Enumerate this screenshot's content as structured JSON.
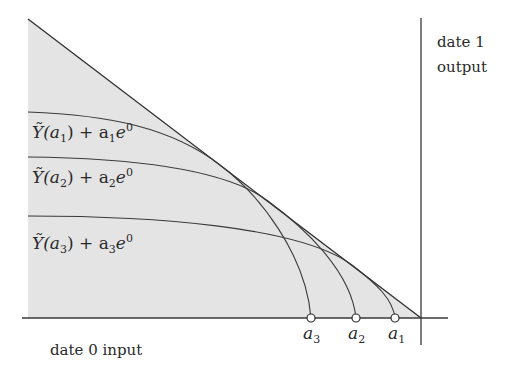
{
  "diagram": {
    "type": "economics-tradeoff-diagram",
    "axes": {
      "x_label": "date 0 input",
      "y_label_line1": "date 1",
      "y_label_line2": "output"
    },
    "colors": {
      "shade": "#e4e4e4",
      "line": "#2e2e2e",
      "axis": "#3a3a3a",
      "text": "#2a2a2a",
      "point_fill": "#ffffff"
    },
    "curves": [
      {
        "id": "curve-a1",
        "label_main": "Ỹ(a",
        "label_sub": "1",
        "label_rest": ") + a",
        "label_sub2": "1",
        "label_e": "e",
        "label_sup": "0",
        "ends_at": "a3"
      },
      {
        "id": "curve-a2",
        "label_main": "Ỹ(a",
        "label_sub": "2",
        "label_rest": ") + a",
        "label_sub2": "2",
        "label_e": "e",
        "label_sup": "0",
        "ends_at": "a2"
      },
      {
        "id": "curve-a3",
        "label_main": "Ỹ(a",
        "label_sub": "3",
        "label_rest": ") + a",
        "label_sub2": "3",
        "label_e": "e",
        "label_sup": "0",
        "ends_at": "a1"
      }
    ],
    "points": [
      {
        "name": "a",
        "sub": "3",
        "x": 311
      },
      {
        "name": "a",
        "sub": "2",
        "x": 356
      },
      {
        "name": "a",
        "sub": "1",
        "x": 395
      }
    ]
  }
}
